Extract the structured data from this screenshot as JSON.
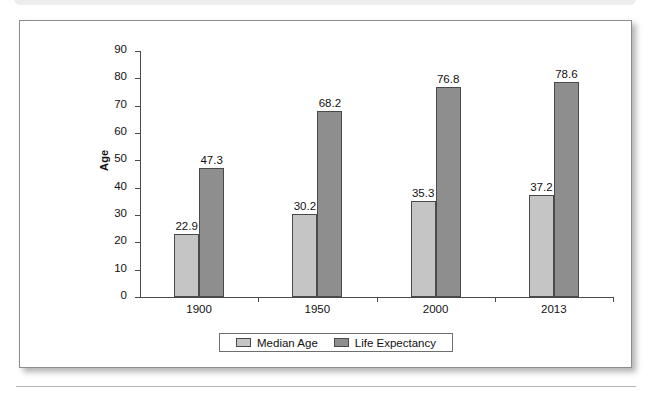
{
  "page": {
    "top_band_label": "",
    "bottom_rule": true
  },
  "chart_data": {
    "type": "bar",
    "title": "",
    "xlabel": "",
    "ylabel": "Age",
    "ylim": [
      0,
      90
    ],
    "ytick_step": 10,
    "yticks": [
      "90",
      "80",
      "70",
      "60",
      "50",
      "40",
      "30",
      "20",
      "10",
      "0"
    ],
    "grid": false,
    "legend_position": "bottom-center",
    "categories": [
      "1900",
      "1950",
      "2000",
      "2013"
    ],
    "series": [
      {
        "name": "Median Age",
        "color": "#c5c5c5",
        "values": [
          22.9,
          30.2,
          35.3,
          37.2
        ],
        "labels": [
          "22.9",
          "30.2",
          "35.3",
          "37.2"
        ]
      },
      {
        "name": "Life Expectancy",
        "color": "#8e8e8e",
        "values": [
          47.3,
          68.2,
          76.8,
          78.6
        ],
        "labels": [
          "47.3",
          "68.2",
          "76.8",
          "78.6"
        ]
      }
    ]
  },
  "colors": {
    "series_median_age": "#c5c5c5",
    "series_life_expectancy": "#8e8e8e",
    "axis": "#4a4a4a",
    "frame_border": "#8d8d8d",
    "text": "#111111"
  }
}
